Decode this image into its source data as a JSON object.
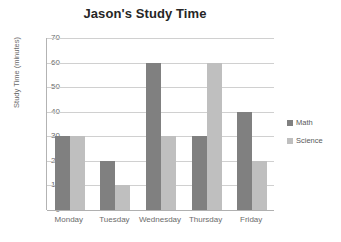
{
  "chart_data": {
    "type": "bar",
    "title": "Jason's Study Time",
    "xlabel": "",
    "ylabel": "Study Time (minutes)",
    "categories": [
      "Monday",
      "Tuesday",
      "Wednesday",
      "Thursday",
      "Friday"
    ],
    "series": [
      {
        "name": "Math",
        "color": "#808080",
        "values": [
          30,
          20,
          60,
          30,
          40
        ]
      },
      {
        "name": "Science",
        "color": "#bfbfbf",
        "values": [
          30,
          10,
          30,
          60,
          20
        ]
      }
    ],
    "ylim": [
      0,
      70
    ],
    "y_ticks": [
      70,
      60,
      50,
      40,
      30,
      20,
      10,
      0
    ],
    "grid": true,
    "legend_position": "right"
  },
  "colors": {
    "background": "#ffffff",
    "title_text": "#262626",
    "tick_text": "#6b6b6b",
    "gridline": "#d0d0d0",
    "axis_line": "#b3b3b3",
    "math": "#808080",
    "science": "#bfbfbf"
  }
}
